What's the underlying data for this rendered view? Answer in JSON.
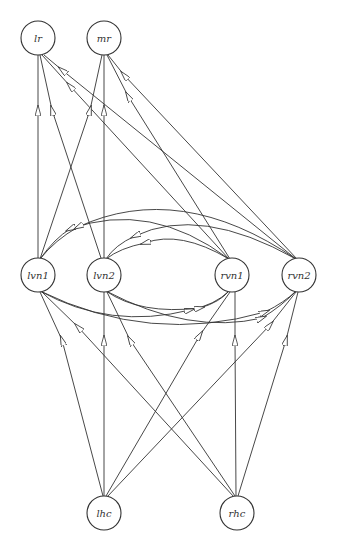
{
  "diagram": {
    "type": "directed-graph",
    "nodes": [
      {
        "id": "lr",
        "label": "lr",
        "x": 38,
        "y": 38
      },
      {
        "id": "mr",
        "label": "mr",
        "x": 104,
        "y": 38
      },
      {
        "id": "lvn1",
        "label": "lvn1",
        "x": 38,
        "y": 275
      },
      {
        "id": "lvn2",
        "label": "lvn2",
        "x": 104,
        "y": 275
      },
      {
        "id": "rvn1",
        "label": "rvn1",
        "x": 232,
        "y": 275
      },
      {
        "id": "rvn2",
        "label": "rvn2",
        "x": 299,
        "y": 275
      },
      {
        "id": "lhc",
        "label": "lhc",
        "x": 104,
        "y": 513
      },
      {
        "id": "rhc",
        "label": "rhc",
        "x": 237,
        "y": 513
      }
    ],
    "edges": [
      {
        "from": "lvn1",
        "to": "lr"
      },
      {
        "from": "lvn2",
        "to": "lr"
      },
      {
        "from": "rvn1",
        "to": "lr"
      },
      {
        "from": "rvn2",
        "to": "lr"
      },
      {
        "from": "lvn1",
        "to": "mr"
      },
      {
        "from": "lvn2",
        "to": "mr"
      },
      {
        "from": "rvn1",
        "to": "mr"
      },
      {
        "from": "rvn2",
        "to": "mr"
      },
      {
        "from": "rvn1",
        "to": "lvn1",
        "curved": "top"
      },
      {
        "from": "rvn2",
        "to": "lvn1",
        "curved": "top"
      },
      {
        "from": "rvn1",
        "to": "lvn2",
        "curved": "top"
      },
      {
        "from": "rvn2",
        "to": "lvn2",
        "curved": "top"
      },
      {
        "from": "lvn1",
        "to": "rvn1",
        "curved": "bottom"
      },
      {
        "from": "lvn2",
        "to": "rvn1",
        "curved": "bottom"
      },
      {
        "from": "lvn1",
        "to": "rvn2",
        "curved": "bottom"
      },
      {
        "from": "lvn2",
        "to": "rvn2",
        "curved": "bottom"
      },
      {
        "from": "lhc",
        "to": "lvn1"
      },
      {
        "from": "lhc",
        "to": "lvn2"
      },
      {
        "from": "lhc",
        "to": "rvn1"
      },
      {
        "from": "lhc",
        "to": "rvn2"
      },
      {
        "from": "rhc",
        "to": "lvn1"
      },
      {
        "from": "rhc",
        "to": "lvn2"
      },
      {
        "from": "rhc",
        "to": "rvn1"
      },
      {
        "from": "rhc",
        "to": "rvn2"
      }
    ]
  },
  "caption": {
    "text": ""
  }
}
